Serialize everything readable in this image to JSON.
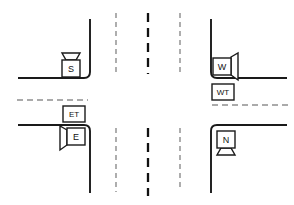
{
  "diagram": {
    "type": "intersection-schematic",
    "canvas": {
      "width": 294,
      "height": 205
    },
    "colors": {
      "background": "#ffffff",
      "road_edge": "#1a1a1a",
      "lane_dash_outer": "#9a9a9a",
      "lane_dash_center": "#111111",
      "lane_dash_horizontal": "#8f8f8f",
      "box_fill": "#ffffff",
      "box_stroke": "#1a1a1a",
      "text": "#111111"
    },
    "roads": {
      "vertical_lane_markings": [
        {
          "name": "left-lane-divider",
          "style": "dashed",
          "color": "#9a9a9a",
          "x": 116
        },
        {
          "name": "center-line",
          "style": "dashed",
          "color": "#111111",
          "x": 148
        },
        {
          "name": "right-lane-divider",
          "style": "dashed",
          "color": "#9a9a9a",
          "x": 180
        }
      ],
      "horizontal_lane_markings": [
        {
          "name": "west-lane-divider",
          "style": "dashed",
          "color": "#8f8f8f",
          "y": 100
        },
        {
          "name": "east-lane-divider",
          "style": "dashed",
          "color": "#8f8f8f",
          "y": 105
        }
      ],
      "corners": [
        {
          "name": "northwest-corner",
          "curb_x": 90,
          "curb_y": 78
        },
        {
          "name": "northeast-corner",
          "curb_x": 211,
          "curb_y": 78
        },
        {
          "name": "southwest-corner",
          "curb_x": 90,
          "curb_y": 125
        },
        {
          "name": "southeast-corner",
          "curb_x": 211,
          "curb_y": 125
        }
      ]
    },
    "sensors": [
      {
        "id": "sensor-s",
        "label": "S",
        "kind": "camera",
        "facing": "north",
        "corner": "northwest-corner",
        "box": {
          "x": 62,
          "y": 60,
          "w": 18,
          "h": 17
        },
        "has_cone": true
      },
      {
        "id": "sensor-w",
        "label": "W",
        "kind": "camera",
        "facing": "east",
        "corner": "northeast-corner",
        "box": {
          "x": 213,
          "y": 58,
          "w": 18,
          "h": 17
        },
        "has_cone": true
      },
      {
        "id": "sensor-wt",
        "label": "WT",
        "kind": "detector",
        "facing": "none",
        "corner": "northeast-corner",
        "box": {
          "x": 212,
          "y": 84,
          "w": 22,
          "h": 16
        },
        "has_cone": false
      },
      {
        "id": "sensor-et",
        "label": "ET",
        "kind": "detector",
        "facing": "none",
        "corner": "southwest-corner",
        "box": {
          "x": 63,
          "y": 106,
          "w": 22,
          "h": 16
        },
        "has_cone": false
      },
      {
        "id": "sensor-e",
        "label": "E",
        "kind": "camera",
        "facing": "west",
        "corner": "southwest-corner",
        "box": {
          "x": 67,
          "y": 128,
          "w": 18,
          "h": 17
        },
        "has_cone": true
      },
      {
        "id": "sensor-n",
        "label": "N",
        "kind": "camera",
        "facing": "south",
        "corner": "southeast-corner",
        "box": {
          "x": 217,
          "y": 131,
          "w": 18,
          "h": 17
        },
        "has_cone": true
      }
    ]
  }
}
